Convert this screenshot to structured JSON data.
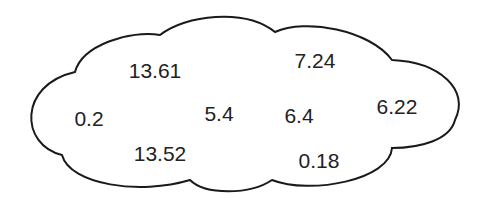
{
  "diagram": {
    "shape": "cloud",
    "stroke_color": "#1a1a1a",
    "fill_color": "#ffffff",
    "values": [
      {
        "id": "v1",
        "text": "13.61",
        "x": 155,
        "y": 70
      },
      {
        "id": "v2",
        "text": "7.24",
        "x": 315,
        "y": 60
      },
      {
        "id": "v3",
        "text": "0.2",
        "x": 89,
        "y": 118
      },
      {
        "id": "v4",
        "text": "5.4",
        "x": 219,
        "y": 113
      },
      {
        "id": "v5",
        "text": "6.4",
        "x": 299,
        "y": 115
      },
      {
        "id": "v6",
        "text": "6.22",
        "x": 397,
        "y": 106
      },
      {
        "id": "v7",
        "text": "13.52",
        "x": 160,
        "y": 153
      },
      {
        "id": "v8",
        "text": "0.18",
        "x": 319,
        "y": 160
      }
    ]
  }
}
